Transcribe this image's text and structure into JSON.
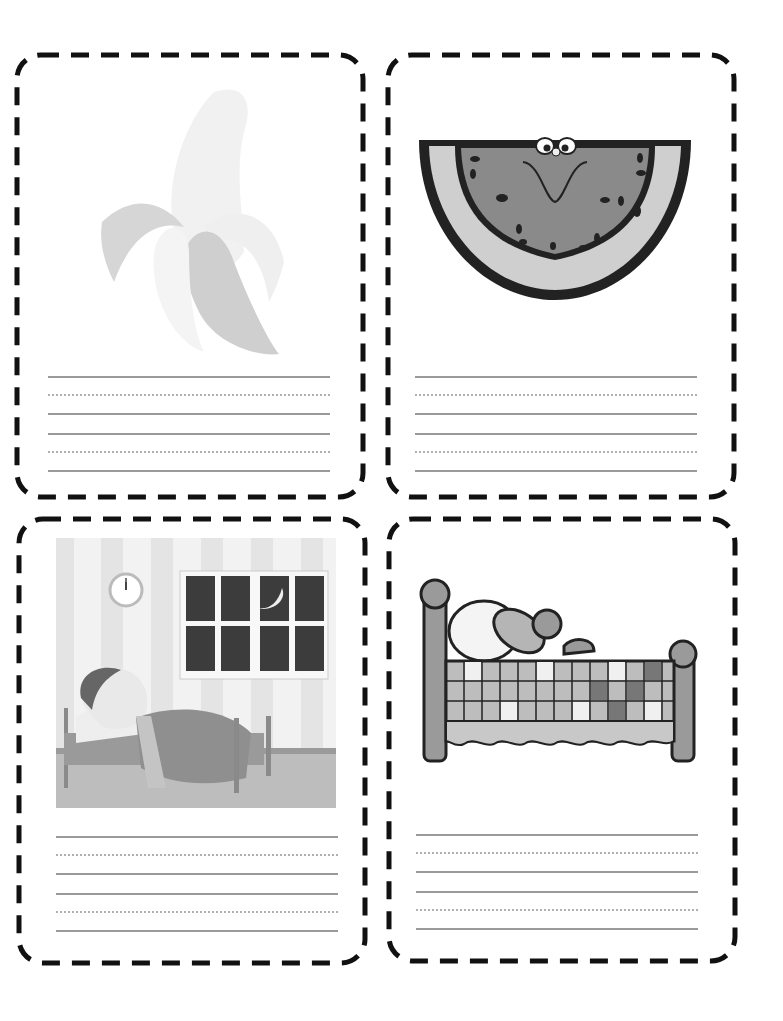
{
  "page": {
    "type": "picture-word flashcards worksheet",
    "background": "#ffffff",
    "border_color": "#111111",
    "line_color": "#9a9a9a"
  },
  "cards": [
    {
      "id": "banana",
      "picture": "banana-icon",
      "description": "peeled banana (faded)",
      "writing_lines": [
        "solid",
        "dotted",
        "solid",
        "solid",
        "dotted",
        "solid"
      ]
    },
    {
      "id": "watermelon",
      "picture": "watermelon-icon",
      "description": "smiling watermelon slice",
      "writing_lines": [
        "solid",
        "dotted",
        "solid",
        "solid",
        "dotted",
        "solid"
      ]
    },
    {
      "id": "bedtime",
      "picture": "boy-in-bed-icon",
      "description": "boy lying in bed at night with clock and moon window",
      "writing_lines": [
        "solid",
        "dotted",
        "solid",
        "solid",
        "dotted",
        "solid"
      ]
    },
    {
      "id": "bed",
      "picture": "quilt-bed-icon",
      "description": "bed with patchwork quilt and teddy bear",
      "writing_lines": [
        "solid",
        "dotted",
        "solid",
        "solid",
        "dotted",
        "solid"
      ]
    }
  ]
}
